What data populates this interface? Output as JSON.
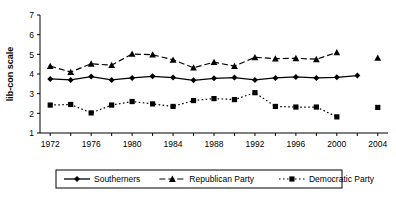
{
  "chart_data": {
    "type": "line",
    "title": "",
    "xlabel": "",
    "ylabel": "lib-con scale",
    "ylim": [
      1,
      7
    ],
    "xlim": [
      1971,
      2005
    ],
    "grid": false,
    "legend_position": "bottom",
    "y_ticks": [
      "1",
      "2",
      "3",
      "4",
      "5",
      "6",
      "7"
    ],
    "x_ticks": [
      "1972",
      "1976",
      "1980",
      "1984",
      "1988",
      "1992",
      "1996",
      "2000",
      "2004"
    ],
    "x_minor_tick_interval": 2,
    "x": [
      1972,
      1974,
      1976,
      1978,
      1980,
      1982,
      1984,
      1986,
      1988,
      1990,
      1992,
      1994,
      1996,
      1998,
      2000,
      2002,
      2004
    ],
    "series": [
      {
        "name": "Southerners",
        "marker": "diamond",
        "line_style": "solid",
        "color": "#000000",
        "values": [
          3.75,
          3.7,
          3.87,
          3.7,
          3.8,
          3.88,
          3.82,
          3.68,
          3.78,
          3.82,
          3.7,
          3.8,
          3.85,
          3.8,
          3.83,
          3.92,
          null
        ],
        "detached_point": null
      },
      {
        "name": "Republican Party",
        "marker": "triangle",
        "line_style": "dashed",
        "color": "#000000",
        "values": [
          4.4,
          4.1,
          4.52,
          4.45,
          5.02,
          4.98,
          4.72,
          4.32,
          4.6,
          4.4,
          4.85,
          4.78,
          4.8,
          4.75,
          5.1,
          null,
          null
        ],
        "detached_point": {
          "x": 2004,
          "y": 4.82
        }
      },
      {
        "name": "Democratic Party",
        "marker": "square",
        "line_style": "dotted",
        "color": "#000000",
        "values": [
          2.42,
          2.45,
          2.02,
          2.42,
          2.6,
          2.48,
          2.35,
          2.65,
          2.75,
          2.7,
          3.05,
          2.35,
          2.32,
          2.32,
          1.82,
          null,
          null
        ],
        "detached_point": {
          "x": 2004,
          "y": 2.3
        }
      }
    ],
    "legend": [
      {
        "label": "Southerners",
        "marker": "diamond",
        "line_style": "solid"
      },
      {
        "label": "Republican Party",
        "marker": "triangle",
        "line_style": "dashed"
      },
      {
        "label": "Democratic Party",
        "marker": "square",
        "line_style": "dotted"
      }
    ]
  }
}
